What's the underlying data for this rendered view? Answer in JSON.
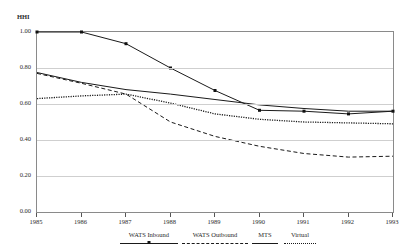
{
  "chart_data": {
    "type": "line",
    "title": "",
    "xlabel": "",
    "ylabel": "HHI",
    "x": [
      1985,
      1986,
      1987,
      1988,
      1989,
      1990,
      1991,
      1992,
      1993
    ],
    "xtick_labels": [
      "1985",
      "1986",
      "1987",
      "1988",
      "1989",
      "1990",
      "1991",
      "1992",
      "1993"
    ],
    "ytick_labels": [
      "0.00",
      "0.20",
      "0.40",
      "0.60",
      "0.80",
      "1.00"
    ],
    "ytick_values": [
      0.0,
      0.2,
      0.4,
      0.6,
      0.8,
      1.0
    ],
    "ylim": [
      0.0,
      1.0
    ],
    "xlim": [
      1985,
      1993
    ],
    "grid": true,
    "legend_position": "bottom",
    "series": [
      {
        "name": "WATS Inbound",
        "style": "solid-markers",
        "values": [
          1.0,
          1.0,
          0.935,
          0.8,
          0.675,
          0.565,
          0.56,
          0.545,
          0.56
        ]
      },
      {
        "name": "WATS Outbound",
        "style": "dashed",
        "values": [
          0.77,
          0.715,
          0.655,
          0.5,
          0.42,
          0.365,
          0.325,
          0.305,
          0.31
        ]
      },
      {
        "name": "MTS",
        "style": "solid",
        "values": [
          0.775,
          0.72,
          0.68,
          0.655,
          0.625,
          0.595,
          0.575,
          0.56,
          0.56
        ]
      },
      {
        "name": "Virtual",
        "style": "dotted",
        "values": [
          0.63,
          0.645,
          0.655,
          0.605,
          0.545,
          0.515,
          0.5,
          0.495,
          0.49
        ]
      }
    ]
  },
  "legend": {
    "items": [
      {
        "label": "WATS Inbound"
      },
      {
        "label": "WATS Outbound"
      },
      {
        "label": "MTS"
      },
      {
        "label": "Virtual"
      }
    ]
  }
}
